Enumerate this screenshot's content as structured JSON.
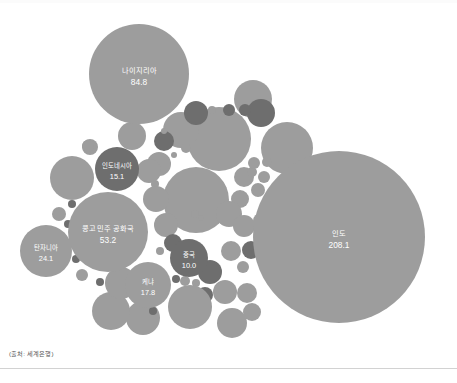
{
  "source_note": "(출처: 세계은행)",
  "colors": {
    "background": "#ffffff",
    "bubble_light": "#9d9d9d",
    "bubble_dark": "#6e6e6e",
    "label_text": "#ffffff",
    "note_text": "#555555",
    "bottom_rule": "#d2d2d2"
  },
  "chart_data": {
    "type": "bubble",
    "title": "",
    "subtitle": "",
    "xlabel": "",
    "ylabel": "",
    "grid": false,
    "legend": "none",
    "value_unit": "million",
    "labeled_points": [
      {
        "name": "인도",
        "value": 208.1,
        "cx": 339,
        "cy": 237,
        "r": 86,
        "tone": "light"
      },
      {
        "name": "나이지리아",
        "value": 84.8,
        "cx": 139,
        "cy": 74,
        "r": 50,
        "tone": "light"
      },
      {
        "name": "콩고 민주 공화국",
        "value": 53.2,
        "cx": 108,
        "cy": 232,
        "r": 40,
        "tone": "light"
      },
      {
        "name": "탄자니아",
        "value": 24.1,
        "cx": 46,
        "cy": 251,
        "r": 26,
        "tone": "light"
      },
      {
        "name": "케냐",
        "value": 17.8,
        "cx": 148,
        "cy": 285,
        "r": 23,
        "tone": "light"
      },
      {
        "name": "인도네시아",
        "value": 15.1,
        "cx": 117,
        "cy": 169,
        "r": 22,
        "tone": "dark"
      },
      {
        "name": "중국",
        "value": 10.0,
        "cx": 189,
        "cy": 258,
        "r": 19,
        "tone": "dark"
      }
    ],
    "unlabeled_points": [
      {
        "cx": 219,
        "cy": 139,
        "r": 32,
        "tone": "light"
      },
      {
        "cx": 196,
        "cy": 200,
        "r": 33,
        "tone": "light"
      },
      {
        "cx": 287,
        "cy": 148,
        "r": 26,
        "tone": "light"
      },
      {
        "cx": 253,
        "cy": 99,
        "r": 19,
        "tone": "light"
      },
      {
        "cx": 181,
        "cy": 130,
        "r": 18,
        "tone": "light"
      },
      {
        "cx": 72,
        "cy": 178,
        "r": 22,
        "tone": "light"
      },
      {
        "cx": 132,
        "cy": 136,
        "r": 14,
        "tone": "light"
      },
      {
        "cx": 159,
        "cy": 164,
        "r": 12,
        "tone": "light"
      },
      {
        "cx": 196,
        "cy": 113,
        "r": 12,
        "tone": "dark"
      },
      {
        "cx": 261,
        "cy": 113,
        "r": 14,
        "tone": "dark"
      },
      {
        "cx": 164,
        "cy": 141,
        "r": 10,
        "tone": "dark"
      },
      {
        "cx": 229,
        "cy": 110,
        "r": 6,
        "tone": "dark"
      },
      {
        "cx": 245,
        "cy": 110,
        "r": 6,
        "tone": "dark"
      },
      {
        "cx": 212,
        "cy": 110,
        "r": 4,
        "tone": "light"
      },
      {
        "cx": 164,
        "cy": 131,
        "r": 3,
        "tone": "light"
      },
      {
        "cx": 186,
        "cy": 148,
        "r": 5,
        "tone": "light"
      },
      {
        "cx": 174,
        "cy": 155,
        "r": 3,
        "tone": "light"
      },
      {
        "cx": 149,
        "cy": 171,
        "r": 12,
        "tone": "light"
      },
      {
        "cx": 155,
        "cy": 184,
        "r": 4,
        "tone": "light"
      },
      {
        "cx": 90,
        "cy": 147,
        "r": 8,
        "tone": "light"
      },
      {
        "cx": 156,
        "cy": 199,
        "r": 13,
        "tone": "light"
      },
      {
        "cx": 166,
        "cy": 225,
        "r": 12,
        "tone": "light"
      },
      {
        "cx": 244,
        "cy": 177,
        "r": 10,
        "tone": "light"
      },
      {
        "cx": 252,
        "cy": 172,
        "r": 5,
        "tone": "light"
      },
      {
        "cx": 264,
        "cy": 177,
        "r": 6,
        "tone": "light"
      },
      {
        "cx": 258,
        "cy": 190,
        "r": 7,
        "tone": "light"
      },
      {
        "cx": 240,
        "cy": 199,
        "r": 9,
        "tone": "light"
      },
      {
        "cx": 229,
        "cy": 214,
        "r": 13,
        "tone": "light"
      },
      {
        "cx": 244,
        "cy": 226,
        "r": 11,
        "tone": "light"
      },
      {
        "cx": 195,
        "cy": 214,
        "r": 4,
        "tone": "light"
      },
      {
        "cx": 201,
        "cy": 218,
        "r": 3,
        "tone": "light"
      },
      {
        "cx": 231,
        "cy": 251,
        "r": 10,
        "tone": "light"
      },
      {
        "cx": 251,
        "cy": 250,
        "r": 9,
        "tone": "dark"
      },
      {
        "cx": 243,
        "cy": 267,
        "r": 6,
        "tone": "light"
      },
      {
        "cx": 173,
        "cy": 243,
        "r": 9,
        "tone": "dark"
      },
      {
        "cx": 160,
        "cy": 251,
        "r": 4,
        "tone": "light"
      },
      {
        "cx": 210,
        "cy": 272,
        "r": 12,
        "tone": "dark"
      },
      {
        "cx": 185,
        "cy": 281,
        "r": 5,
        "tone": "light"
      },
      {
        "cx": 196,
        "cy": 283,
        "r": 4,
        "tone": "light"
      },
      {
        "cx": 176,
        "cy": 279,
        "r": 4,
        "tone": "dark"
      },
      {
        "cx": 205,
        "cy": 295,
        "r": 8,
        "tone": "dark"
      },
      {
        "cx": 225,
        "cy": 292,
        "r": 12,
        "tone": "light"
      },
      {
        "cx": 247,
        "cy": 293,
        "r": 10,
        "tone": "light"
      },
      {
        "cx": 252,
        "cy": 312,
        "r": 9,
        "tone": "light"
      },
      {
        "cx": 190,
        "cy": 307,
        "r": 22,
        "tone": "light"
      },
      {
        "cx": 232,
        "cy": 323,
        "r": 15,
        "tone": "light"
      },
      {
        "cx": 143,
        "cy": 318,
        "r": 17,
        "tone": "light"
      },
      {
        "cx": 111,
        "cy": 311,
        "r": 19,
        "tone": "light"
      },
      {
        "cx": 153,
        "cy": 311,
        "r": 4,
        "tone": "dark"
      },
      {
        "cx": 121,
        "cy": 283,
        "r": 16,
        "tone": "light"
      },
      {
        "cx": 82,
        "cy": 275,
        "r": 6,
        "tone": "light"
      },
      {
        "cx": 100,
        "cy": 282,
        "r": 4,
        "tone": "dark"
      },
      {
        "cx": 76,
        "cy": 259,
        "r": 4,
        "tone": "dark"
      },
      {
        "cx": 68,
        "cy": 224,
        "r": 4,
        "tone": "dark"
      },
      {
        "cx": 72,
        "cy": 204,
        "r": 4,
        "tone": "dark"
      },
      {
        "cx": 59,
        "cy": 214,
        "r": 7,
        "tone": "light"
      },
      {
        "cx": 88,
        "cy": 146,
        "r": 6,
        "tone": "light"
      },
      {
        "cx": 276,
        "cy": 196,
        "r": 5,
        "tone": "light"
      },
      {
        "cx": 268,
        "cy": 206,
        "r": 7,
        "tone": "light"
      },
      {
        "cx": 261,
        "cy": 221,
        "r": 8,
        "tone": "light"
      },
      {
        "cx": 254,
        "cy": 163,
        "r": 6,
        "tone": "light"
      },
      {
        "cx": 267,
        "cy": 162,
        "r": 5,
        "tone": "light"
      },
      {
        "cx": 270,
        "cy": 246,
        "r": 8,
        "tone": "dark"
      }
    ]
  }
}
